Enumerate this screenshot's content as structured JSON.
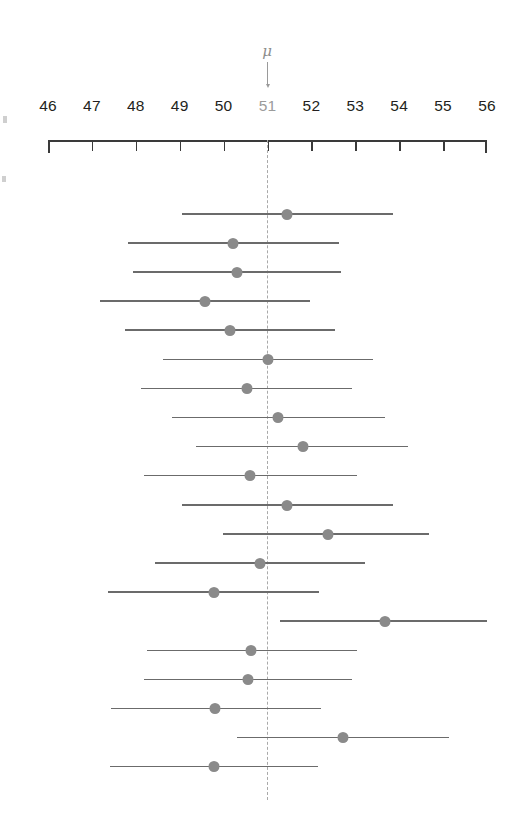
{
  "figure": {
    "title": "",
    "mu_symbol": "μ",
    "background_color": "#ffffff",
    "line_color": "#6b6b6b",
    "dot_color": "#8a8a8a",
    "axis_color": "#3a3a3a",
    "reference_color": "#a9a9a9",
    "mu_label_color": "#9b9b9b"
  },
  "chart_data": {
    "type": "scatter",
    "title": "",
    "subtitle": "",
    "xlabel": "",
    "ylabel": "",
    "xlim": [
      46,
      56
    ],
    "xticks": [
      46,
      47,
      48,
      49,
      50,
      51,
      52,
      53,
      54,
      55,
      56
    ],
    "xtick_labels": [
      "46",
      "47",
      "48",
      "49",
      "50",
      "51",
      "52",
      "53",
      "54",
      "55",
      "56"
    ],
    "grid": false,
    "legend": "none",
    "annotations": [
      {
        "text": "μ",
        "x": 51,
        "kind": "arrow-down",
        "note": "population mean reference line at x = 51"
      }
    ],
    "reference_line": {
      "x": 51,
      "style": "dashed",
      "label": "μ"
    },
    "series": [
      {
        "name": "confidence intervals",
        "error_bar_orientation": "horizontal",
        "point_count": 20,
        "points": [
          {
            "index": 1,
            "mean": 51.45,
            "low": 49.05,
            "high": 53.85,
            "contains_mu": true
          },
          {
            "index": 2,
            "mean": 50.22,
            "low": 47.83,
            "high": 52.62,
            "contains_mu": true
          },
          {
            "index": 3,
            "mean": 50.31,
            "low": 47.94,
            "high": 52.68,
            "contains_mu": true
          },
          {
            "index": 4,
            "mean": 49.58,
            "low": 47.18,
            "high": 51.97,
            "contains_mu": true
          },
          {
            "index": 5,
            "mean": 50.15,
            "low": 47.76,
            "high": 52.54,
            "contains_mu": true
          },
          {
            "index": 6,
            "mean": 51.02,
            "low": 48.62,
            "high": 53.4,
            "contains_mu": true
          },
          {
            "index": 7,
            "mean": 50.53,
            "low": 48.12,
            "high": 52.92,
            "contains_mu": true
          },
          {
            "index": 8,
            "mean": 51.23,
            "low": 48.83,
            "high": 53.67,
            "contains_mu": true
          },
          {
            "index": 9,
            "mean": 51.8,
            "low": 49.38,
            "high": 54.2,
            "contains_mu": true
          },
          {
            "index": 10,
            "mean": 50.6,
            "low": 48.19,
            "high": 53.04,
            "contains_mu": true
          },
          {
            "index": 11,
            "mean": 51.45,
            "low": 49.05,
            "high": 53.85,
            "contains_mu": true
          },
          {
            "index": 12,
            "mean": 52.37,
            "low": 49.98,
            "high": 54.68,
            "contains_mu": true
          },
          {
            "index": 13,
            "mean": 50.82,
            "low": 48.44,
            "high": 53.22,
            "contains_mu": true
          },
          {
            "index": 14,
            "mean": 49.77,
            "low": 47.37,
            "high": 52.17,
            "contains_mu": true
          },
          {
            "index": 15,
            "mean": 53.67,
            "low": 51.28,
            "high": 56.01,
            "contains_mu": false
          },
          {
            "index": 16,
            "mean": 50.62,
            "low": 48.25,
            "high": 53.05,
            "contains_mu": true
          },
          {
            "index": 17,
            "mean": 50.55,
            "low": 48.18,
            "high": 52.93,
            "contains_mu": true
          },
          {
            "index": 18,
            "mean": 49.8,
            "low": 47.43,
            "high": 52.21,
            "contains_mu": true
          },
          {
            "index": 19,
            "mean": 52.72,
            "low": 50.31,
            "high": 55.14,
            "contains_mu": false
          },
          {
            "index": 20,
            "mean": 49.78,
            "low": 47.41,
            "high": 52.16,
            "contains_mu": true
          }
        ]
      }
    ]
  }
}
